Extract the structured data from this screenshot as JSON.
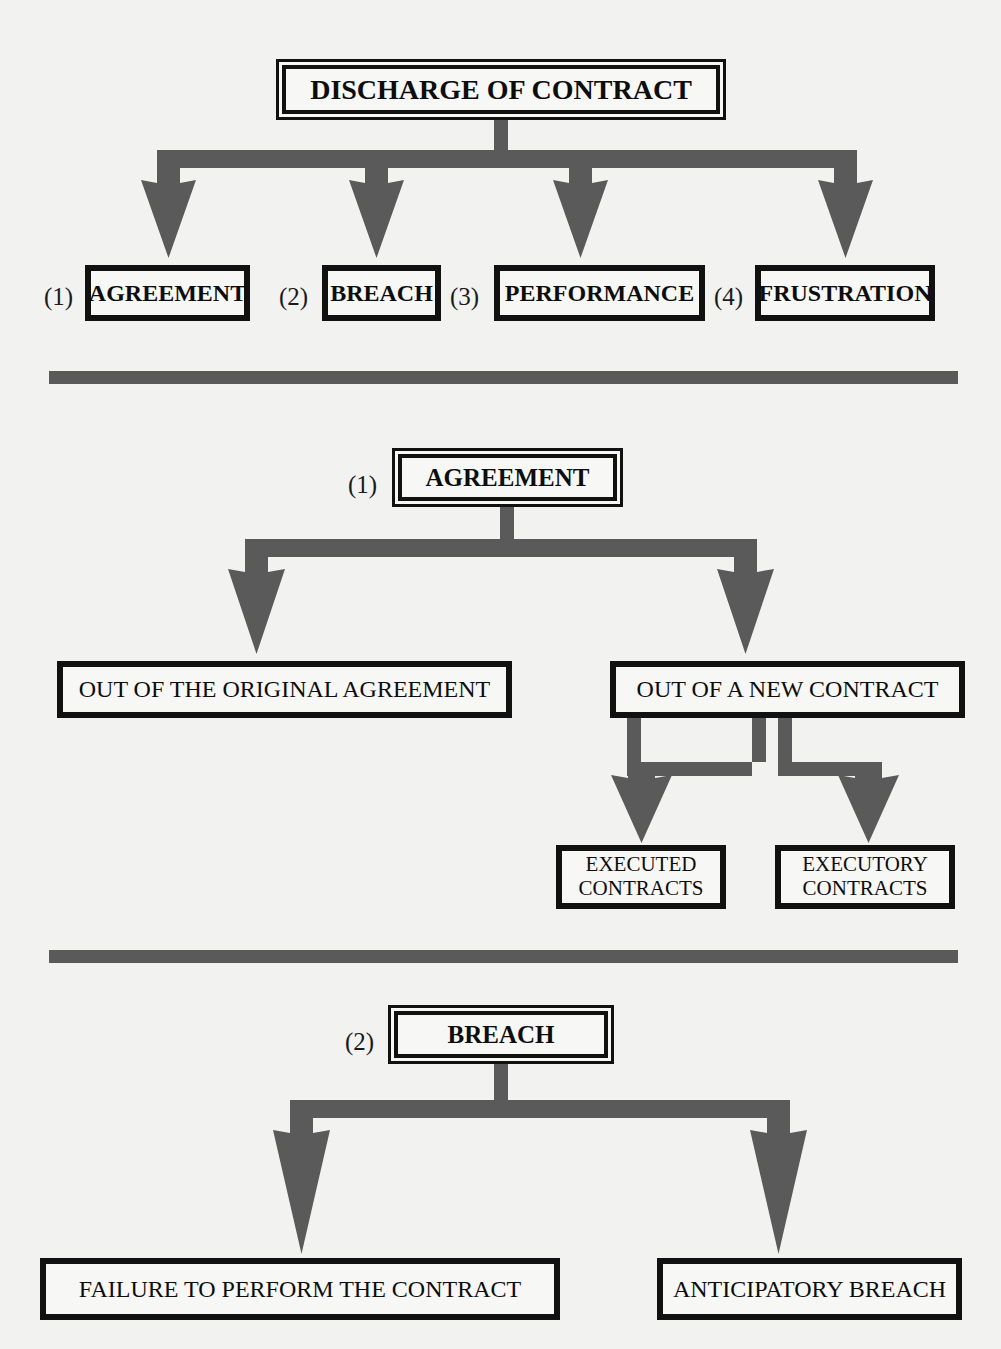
{
  "page": {
    "title": "Discharge of Contract",
    "background_color": "#f2f2f0",
    "ink_color": "#111111",
    "connector_color": "#5a5a5a"
  },
  "section1": {
    "root": {
      "label": "DISCHARGE OF CONTRACT"
    },
    "children": [
      {
        "number": "(1)",
        "label": "AGREEMENT"
      },
      {
        "number": "(2)",
        "label": "BREACH"
      },
      {
        "number": "(3)",
        "label": "PERFORMANCE"
      },
      {
        "number": "(4)",
        "label": "FRUSTRATION"
      }
    ]
  },
  "section2": {
    "root": {
      "number": "(1)",
      "label": "AGREEMENT"
    },
    "children": [
      {
        "label": "OUT OF THE ORIGINAL AGREEMENT"
      },
      {
        "label": "OUT OF A NEW CONTRACT"
      }
    ],
    "grandchildren": [
      {
        "line1": "EXECUTED",
        "line2": "CONTRACTS"
      },
      {
        "line1": "EXECUTORY",
        "line2": "CONTRACTS"
      }
    ]
  },
  "section3": {
    "root": {
      "number": "(2)",
      "label": "BREACH"
    },
    "children": [
      {
        "label": "FAILURE TO PERFORM THE CONTRACT"
      },
      {
        "label": "ANTICIPATORY BREACH"
      }
    ]
  }
}
